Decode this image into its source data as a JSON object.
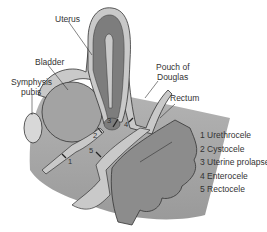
{
  "labels": {
    "uterus": "Uterus",
    "bladder": "Bladder",
    "symphysis_line1": "Symphysis",
    "symphysis_line2": "pubis",
    "pouch_line1": "Pouch of",
    "pouch_line2": "Douglas",
    "rectum": "Rectum"
  },
  "markers": [
    "1",
    "2",
    "3",
    "4",
    "5"
  ],
  "legend": [
    {
      "num": "1",
      "name": "Urethrocele"
    },
    {
      "num": "2",
      "name": "Cystocele"
    },
    {
      "num": "3",
      "name": "Uterine prolapse"
    },
    {
      "num": "4",
      "name": "Enterocele"
    },
    {
      "num": "5",
      "name": "Rectocele"
    }
  ],
  "colors": {
    "background": "#ffffff",
    "tissue_light": "#c9c9c9",
    "tissue_mid": "#a3a3a3",
    "organ_dark": "#7d7d7d",
    "outline": "#333333",
    "text": "#333333"
  }
}
